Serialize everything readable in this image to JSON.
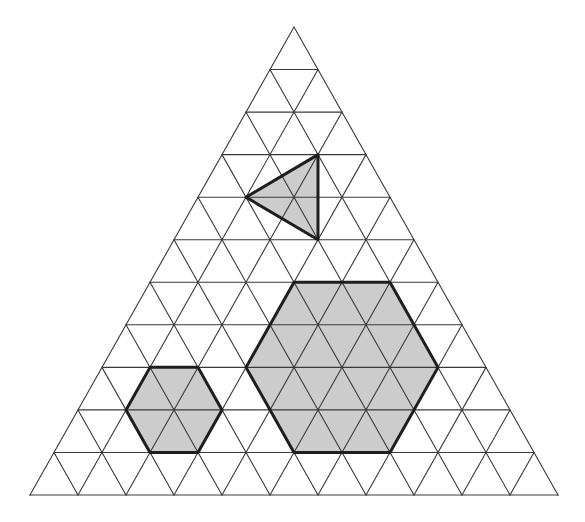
{
  "diagram": {
    "type": "triangular-lattice",
    "rows": 11,
    "apex": [
      294,
      27
    ],
    "base_left": [
      30,
      495
    ],
    "base_right": [
      558,
      495
    ],
    "colors": {
      "background": "#ffffff",
      "grid_line": "#3a3a3a",
      "shape_outline": "#1e1e1e",
      "shape_fill": "#cccccc"
    },
    "shapes": [
      {
        "name": "small-triangle",
        "kind": "triangle",
        "vertices_rc": [
          [
            3,
            2
          ],
          [
            4,
            1
          ],
          [
            5,
            3
          ]
        ]
      },
      {
        "name": "large-hexagon",
        "kind": "hexagon",
        "side_units": 2,
        "vertices_rc": [
          [
            6,
            3
          ],
          [
            6,
            5
          ],
          [
            8,
            7
          ],
          [
            10,
            7
          ],
          [
            10,
            5
          ],
          [
            8,
            3
          ]
        ]
      },
      {
        "name": "small-hexagon",
        "kind": "hexagon",
        "side_units": 1,
        "vertices_rc": [
          [
            8,
            1
          ],
          [
            8,
            2
          ],
          [
            9,
            3
          ],
          [
            10,
            3
          ],
          [
            10,
            2
          ],
          [
            9,
            1
          ]
        ]
      }
    ]
  }
}
